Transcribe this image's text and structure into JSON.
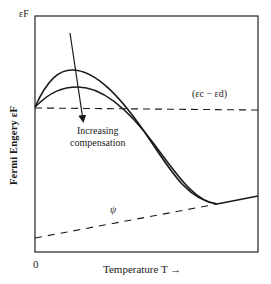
{
  "figure": {
    "y_axis_label": "Fermi Engery εF",
    "y_axis_top_tick": "εF",
    "x_axis_origin": "0",
    "x_axis_label": "Temperature T →",
    "annotations": {
      "compensation_line1": "Increasing",
      "compensation_line2": "compensation",
      "energy_gap": "(εc − εd)",
      "psi": "ψ"
    },
    "colors": {
      "line": "#1a1a1a",
      "axis": "#333333",
      "background": "#ffffff"
    }
  },
  "geometry": {
    "axes_box": {
      "left": 35,
      "top": 16,
      "right": 258,
      "bottom": 252
    },
    "curves": [
      {
        "name": "upper-curve",
        "d": "M35,107 C48,78 60,70 72,70 C95,70 120,95 150,140 C175,178 190,200 217,204"
      },
      {
        "name": "lower-curve",
        "d": "M35,107 C50,92 62,87 78,87 C100,87 125,105 154,144 C178,176 195,202 217,204"
      },
      {
        "name": "high-temp-line",
        "d": "M217,204 L258,196"
      }
    ],
    "dashed_lines": [
      {
        "name": "gap-reference-line",
        "x1": 35,
        "y1": 108,
        "x2": 258,
        "y2": 110
      },
      {
        "name": "psi-line",
        "x1": 35,
        "y1": 238,
        "x2": 217,
        "y2": 204
      }
    ],
    "arrow": {
      "x1": 70,
      "y1": 33,
      "x2": 83,
      "y2": 120
    }
  }
}
